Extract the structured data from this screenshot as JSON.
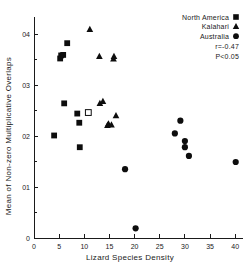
{
  "chart_data": {
    "type": "scatter",
    "title": "",
    "xlabel": "Lizard Species Density",
    "ylabel": "Mean of Non-zero Multiplicative Overlaps",
    "xlim": [
      0,
      42
    ],
    "ylim": [
      0,
      0.43
    ],
    "xticks": [
      0,
      5,
      10,
      15,
      20,
      25,
      30,
      35,
      40
    ],
    "xticklabels": [
      "0",
      "5",
      "10",
      "15",
      "20",
      "25",
      "30",
      "35",
      "40"
    ],
    "yticks": [
      0,
      0.1,
      0.2,
      0.3,
      0.4
    ],
    "yticklabels": [
      "0",
      "01",
      "02",
      "03",
      "04"
    ],
    "yticklabels_display": [
      "0",
      "0.1",
      "0.2",
      "0.3",
      "0.4"
    ],
    "minor_yticks": [
      0.05,
      0.15,
      0.25,
      0.35
    ],
    "grid": false,
    "legend_position": "top-right",
    "annotations": [
      "r=-0.47",
      "P<0.05"
    ],
    "series": [
      {
        "name": "North America",
        "marker": "square",
        "color": "#0d0d0d",
        "points": [
          {
            "x": 4.0,
            "y": 0.201
          },
          {
            "x": 5.2,
            "y": 0.352
          },
          {
            "x": 5.4,
            "y": 0.358
          },
          {
            "x": 5.8,
            "y": 0.359
          },
          {
            "x": 6.0,
            "y": 0.264
          },
          {
            "x": 6.6,
            "y": 0.382
          },
          {
            "x": 8.6,
            "y": 0.244
          },
          {
            "x": 9.0,
            "y": 0.226
          },
          {
            "x": 9.1,
            "y": 0.178
          },
          {
            "x": 10.8,
            "y": 0.246,
            "open": true
          }
        ]
      },
      {
        "name": "Kalahari",
        "marker": "triangle",
        "color": "#0d0d0d",
        "points": [
          {
            "x": 11.1,
            "y": 0.409
          },
          {
            "x": 13.0,
            "y": 0.356
          },
          {
            "x": 13.1,
            "y": 0.264
          },
          {
            "x": 13.7,
            "y": 0.268
          },
          {
            "x": 14.6,
            "y": 0.221
          },
          {
            "x": 14.8,
            "y": 0.224
          },
          {
            "x": 15.4,
            "y": 0.222
          },
          {
            "x": 15.8,
            "y": 0.351
          },
          {
            "x": 15.9,
            "y": 0.356
          },
          {
            "x": 16.3,
            "y": 0.24
          }
        ]
      },
      {
        "name": "Australia",
        "marker": "circle",
        "color": "#0d0d0d",
        "points": [
          {
            "x": 18.1,
            "y": 0.135
          },
          {
            "x": 20.2,
            "y": 0.019
          },
          {
            "x": 28.0,
            "y": 0.205
          },
          {
            "x": 29.1,
            "y": 0.23
          },
          {
            "x": 30.0,
            "y": 0.19
          },
          {
            "x": 30.0,
            "y": 0.178
          },
          {
            "x": 30.8,
            "y": 0.161
          },
          {
            "x": 40.1,
            "y": 0.149
          }
        ]
      }
    ]
  },
  "legend": {
    "entries": [
      {
        "label": "North America",
        "marker": "square"
      },
      {
        "label": "Kalahari",
        "marker": "triangle"
      },
      {
        "label": "Australia",
        "marker": "circle"
      }
    ],
    "stats": [
      {
        "text": "r=-0.47"
      },
      {
        "text": "P<0.05"
      }
    ]
  },
  "colors": {
    "marker": "#0d0d0d",
    "axis": "#1a1a1a",
    "background": "#ffffff"
  }
}
